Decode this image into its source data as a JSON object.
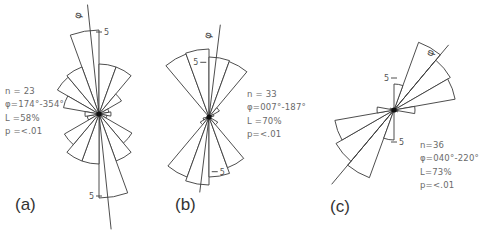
{
  "figure": {
    "panels": [
      {
        "id": "a",
        "label": "(a)",
        "stats": {
          "n": "n = 23",
          "phi": "φ=174°-354°",
          "L": "L =58%",
          "p": "p =<.01"
        },
        "center": [
          99,
          114
        ],
        "axis_deg": 354,
        "axis_len_pos": 110,
        "axis_len_neg": 116,
        "scale_px_per_unit": 18,
        "scale_marks": [
          {
            "text": "5",
            "deg": 0,
            "r": 82,
            "side": "right"
          },
          {
            "text": "5",
            "deg": 180,
            "r": 82,
            "side": "left"
          }
        ],
        "petals": [
          {
            "deg": 350,
            "r": 84
          },
          {
            "deg": 10,
            "r": 50
          },
          {
            "deg": 30,
            "r": 50
          },
          {
            "deg": 50,
            "r": 26
          },
          {
            "deg": 310,
            "r": 48
          },
          {
            "deg": 330,
            "r": 50
          },
          {
            "deg": 290,
            "r": 36
          },
          {
            "deg": 70,
            "r": 10
          },
          {
            "deg": 90,
            "r": 12
          },
          {
            "deg": 110,
            "r": 8
          },
          {
            "deg": 250,
            "r": 12
          },
          {
            "deg": 270,
            "r": 14
          },
          {
            "deg": 130,
            "r": 38
          },
          {
            "deg": 150,
            "r": 50
          },
          {
            "deg": 170,
            "r": 84
          },
          {
            "deg": 190,
            "r": 50
          },
          {
            "deg": 210,
            "r": 50
          },
          {
            "deg": 230,
            "r": 40
          }
        ]
      },
      {
        "id": "b",
        "label": "(b)",
        "stats": {
          "n": "n = 33",
          "phi": "φ=007°-187°",
          "L": "L =70%",
          "p": "p=<.01"
        },
        "center": [
          209,
          117
        ],
        "axis_deg": 7,
        "axis_len_pos": 93,
        "axis_len_neg": 76,
        "scale_px_per_unit": 11,
        "scale_marks": [
          {
            "text": "5",
            "deg": 354,
            "r": 55,
            "side": "left"
          },
          {
            "text": "5",
            "deg": 174,
            "r": 55,
            "side": "right"
          }
        ],
        "petals": [
          {
            "deg": 330,
            "r": 67
          },
          {
            "deg": 350,
            "r": 68
          },
          {
            "deg": 10,
            "r": 60
          },
          {
            "deg": 30,
            "r": 59
          },
          {
            "deg": 50,
            "r": 12
          },
          {
            "deg": 70,
            "r": 5
          },
          {
            "deg": 250,
            "r": 6
          },
          {
            "deg": 230,
            "r": 10
          },
          {
            "deg": 210,
            "r": 64
          },
          {
            "deg": 190,
            "r": 68
          },
          {
            "deg": 170,
            "r": 60
          },
          {
            "deg": 150,
            "r": 54
          },
          {
            "deg": 130,
            "r": 10
          }
        ]
      },
      {
        "id": "c",
        "label": "(c)",
        "stats": {
          "n": "n=36",
          "phi": "φ=040°-220°",
          "L": "L=73%",
          "p": "p=<.01"
        },
        "center": [
          394,
          110
        ],
        "axis_deg": 40,
        "axis_len_pos": 85,
        "axis_len_neg": 97,
        "scale_px_per_unit": 6,
        "scale_marks": [
          {
            "text": "5",
            "deg": 0,
            "r": 32,
            "side": "left"
          },
          {
            "text": "5",
            "deg": 180,
            "r": 32,
            "side": "right"
          }
        ],
        "petals": [
          {
            "deg": 30,
            "r": 72
          },
          {
            "deg": 50,
            "r": 65
          },
          {
            "deg": 70,
            "r": 62
          },
          {
            "deg": 90,
            "r": 21
          },
          {
            "deg": 10,
            "r": 26
          },
          {
            "deg": 110,
            "r": 4
          },
          {
            "deg": 210,
            "r": 72
          },
          {
            "deg": 230,
            "r": 67
          },
          {
            "deg": 250,
            "r": 60
          },
          {
            "deg": 270,
            "r": 17
          },
          {
            "deg": 190,
            "r": 30
          },
          {
            "deg": 290,
            "r": 4
          }
        ]
      }
    ],
    "stroke_color": "#3a3a3a",
    "text_color": "#6a6a6a",
    "label_color": "#333333"
  }
}
